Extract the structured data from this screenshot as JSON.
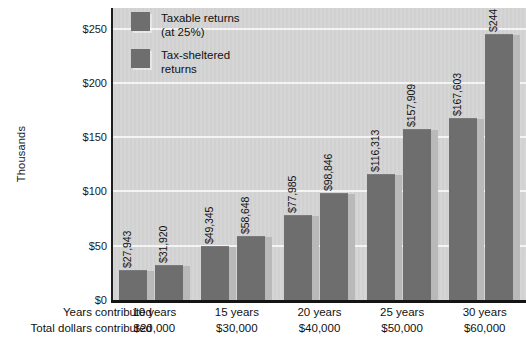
{
  "chart_data": {
    "type": "bar",
    "title": "",
    "subtitle": "",
    "xlabel": "",
    "ylabel": "Thousands",
    "ylim": [
      0,
      270
    ],
    "yticks": [
      "$0",
      "$50",
      "$100",
      "$150",
      "$200",
      "$250"
    ],
    "ytick_values": [
      0,
      50,
      100,
      150,
      200,
      250
    ],
    "grid": true,
    "legend_position": "top-left",
    "categories": [
      "10 years",
      "15 years",
      "20 years",
      "25 years",
      "30 years"
    ],
    "series": [
      {
        "name": "Taxable returns (at 25%)",
        "values": [
          27943,
          49345,
          77985,
          116313,
          167603
        ],
        "labels": [
          "$27,943",
          "$49,345",
          "$77,985",
          "$116,313",
          "$167,603"
        ],
        "color": "#6e6e6e"
      },
      {
        "name": "Tax-sheltered returns",
        "values": [
          31920,
          58648,
          98846,
          157909,
          244691
        ],
        "labels": [
          "$31,920",
          "$58,648",
          "$98,846",
          "$157,909",
          "$244,691"
        ],
        "color": "#6e6e6e"
      }
    ],
    "annotations": {
      "total_dollars_contributed": [
        "$20,000",
        "$30,000",
        "$40,000",
        "$50,000",
        "$60,000"
      ]
    }
  },
  "legend": {
    "items": [
      {
        "line1": "Taxable returns",
        "line2": "(at 25%)"
      },
      {
        "line1": "Tax-sheltered",
        "line2": "returns"
      }
    ]
  },
  "axis": {
    "y_title": "Thousands",
    "y_labels": [
      "$250",
      "$200",
      "$150",
      "$100",
      "$50",
      "$0"
    ]
  },
  "bottom_table": {
    "row_labels": [
      "Years contributed",
      "Total dollars contributed"
    ],
    "rows": [
      [
        "10 years",
        "15 years",
        "20 years",
        "25 years",
        "30 years"
      ],
      [
        "$20,000",
        "$30,000",
        "$40,000",
        "$50,000",
        "$60,000"
      ]
    ]
  },
  "colors": {
    "bar_face": "#6e6e6e",
    "bar_side": "#b9b9b9",
    "plot_background": "#d6d6d6",
    "gridline": "#f4f4f4",
    "axis": "#141414"
  }
}
